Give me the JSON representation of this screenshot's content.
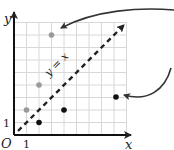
{
  "diagram": {
    "type": "coordinate-plane",
    "axes": {
      "x_label": "x",
      "y_label": "y",
      "origin_label": "O",
      "x_tick_label": "1",
      "y_tick_label": "1"
    },
    "line": {
      "label": "y = x",
      "style": "dashed",
      "color": "#222222"
    },
    "grid": {
      "color": "#d8d8d8",
      "cells_x": 9,
      "cells_y": 9
    },
    "points_gray": [
      {
        "x": 1,
        "y": 2,
        "color": "#999999"
      },
      {
        "x": 2,
        "y": 4,
        "color": "#999999"
      },
      {
        "x": 3,
        "y": 8,
        "color": "#999999"
      }
    ],
    "points_black": [
      {
        "x": 2,
        "y": 1,
        "color": "#111111"
      },
      {
        "x": 4,
        "y": 2,
        "color": "#111111"
      },
      {
        "x": 8,
        "y": 4,
        "color": "#111111"
      }
    ],
    "arrow_annotation": {
      "description": "curved arrow from gray point (3,8) around right side to black point (8,4), indicating reflection across y = x",
      "color": "#333333"
    }
  }
}
